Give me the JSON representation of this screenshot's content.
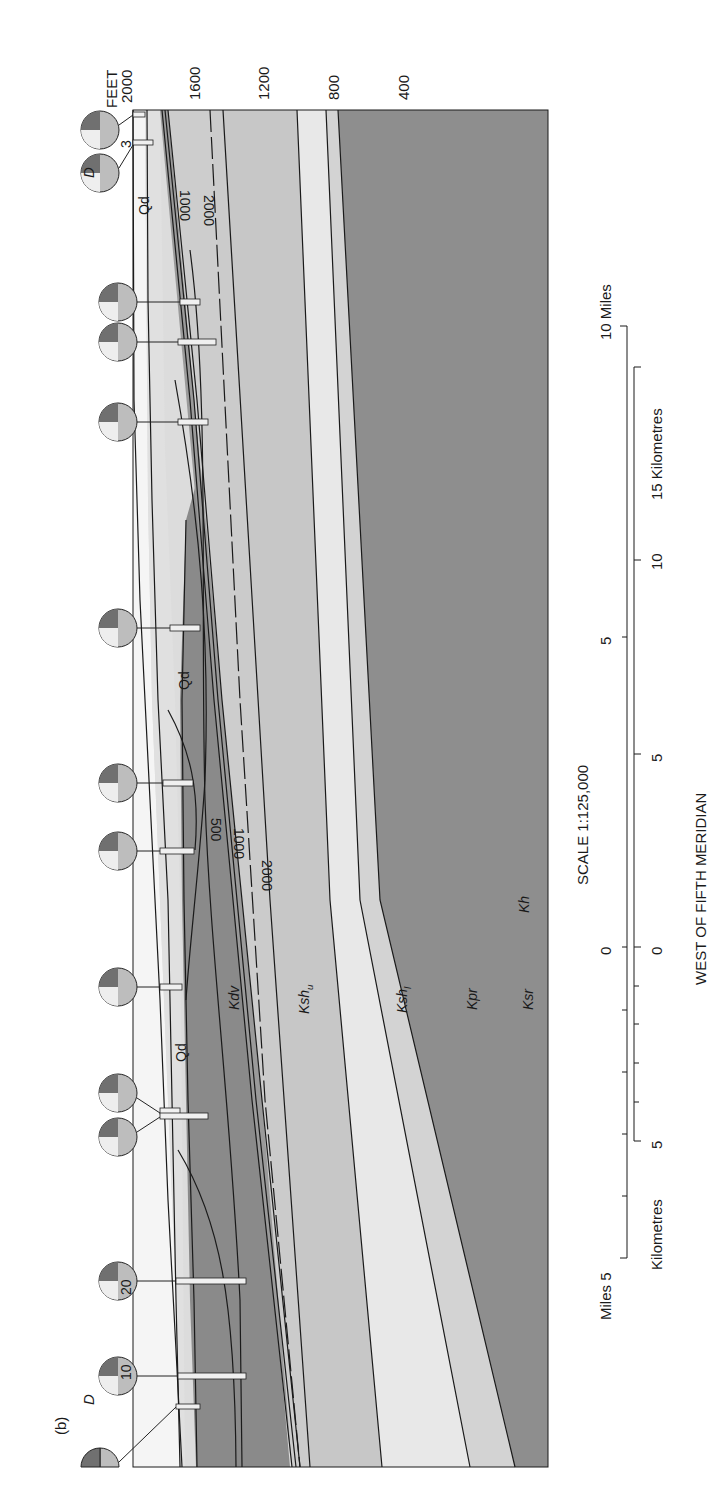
{
  "figure": {
    "panel_label": "(b)",
    "orientation": "rotated 90 degrees clockwise",
    "elevation_axis": {
      "unit_label": "FEET",
      "ticks": [
        "2000",
        "1600",
        "1200",
        "800",
        "400"
      ]
    },
    "units": [
      {
        "code": "Qd",
        "label": "Qd",
        "color": "#f4f4f4"
      },
      {
        "code": "Kdv",
        "label": "Kdv",
        "color": "#8a8a8a"
      },
      {
        "code": "Ksh_u",
        "label": "Ksh",
        "subscript": "u",
        "color": "#cbcbcb"
      },
      {
        "code": "Ksh_l",
        "label": "Ksh",
        "subscript": "l",
        "color": "#c6c6c6"
      },
      {
        "code": "Kpr",
        "label": "Kpr",
        "color": "#e6e6e6"
      },
      {
        "code": "Kh",
        "label": "Kh",
        "color": "#cfcfcf"
      },
      {
        "code": "Ksr",
        "label": "Ksr",
        "color": "#8c8c8c"
      }
    ],
    "contour_labels": [
      "1000",
      "2000",
      "500",
      "1000",
      "2000"
    ],
    "well_annotations": [
      "D",
      "3",
      "20",
      "10",
      "D"
    ],
    "scale": {
      "title": "SCALE 1:125,000",
      "miles_label_start": "Miles 5",
      "miles_ticks": [
        "5",
        "0",
        "5"
      ],
      "miles_label_end": "10 Miles",
      "km_label_start": "Kilometres",
      "km_ticks": [
        "5",
        "0",
        "5",
        "10"
      ],
      "km_label_end": "15 Kilometres",
      "meridian": "WEST OF FIFTH MERIDIAN"
    }
  }
}
